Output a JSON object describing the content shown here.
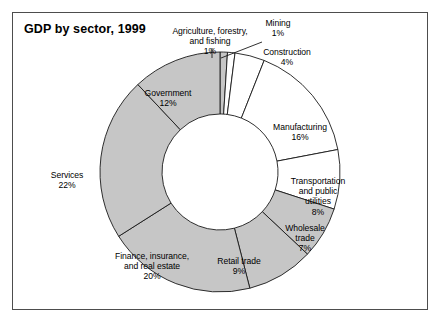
{
  "figure": {
    "title": "GDP by sector, 1999",
    "frame_color": "#4d4d4d",
    "background": "#ffffff"
  },
  "chart_data": {
    "type": "pie",
    "variant": "donut",
    "title": "GDP by sector, 1999",
    "xlabel": "",
    "ylabel": "",
    "units": "percent of GDP",
    "year": "1999",
    "total": 100,
    "legend": "none",
    "grid": false,
    "start_angle_deg": 0,
    "direction": "clockwise",
    "categories": [
      "Agriculture, forestry, and fishing",
      "Mining",
      "Construction",
      "Manufacturing",
      "Transportation and public utilities",
      "Wholesale trade",
      "Retail trade",
      "Finance, insurance, and real estate",
      "Services",
      "Government"
    ],
    "values": [
      1,
      1,
      4,
      16,
      8,
      7,
      9,
      20,
      22,
      12
    ],
    "slices": [
      {
        "label": "Agriculture, forestry,\nand fishing",
        "label_flat": "Agriculture, forestry, and fishing",
        "value": 1,
        "pct_text": "1%",
        "fill": "#c6c6c6",
        "label_x": 152,
        "label_y": 26,
        "label_w": 116,
        "label_align": "center",
        "leader": [
          [
            212,
            58
          ],
          [
            212,
            48
          ]
        ]
      },
      {
        "label": "Mining",
        "label_flat": "Mining",
        "value": 1,
        "pct_text": "1%",
        "fill": "#ffffff",
        "label_x": 252,
        "label_y": 18,
        "label_w": 52,
        "label_align": "center",
        "leader": [
          [
            221,
            58
          ],
          [
            262,
            42
          ]
        ]
      },
      {
        "label": "Construction",
        "label_flat": "Construction",
        "value": 4,
        "pct_text": "4%",
        "fill": "#ffffff",
        "label_x": 250,
        "label_y": 47,
        "label_w": 74,
        "label_align": "center",
        "leader": null
      },
      {
        "label": "Manufacturing",
        "label_flat": "Manufacturing",
        "value": 16,
        "pct_text": "16%",
        "fill": "#ffffff",
        "label_x": 258,
        "label_y": 122,
        "label_w": 84,
        "label_align": "center",
        "leader": null
      },
      {
        "label": "Transportation\nand public\nutilities",
        "label_flat": "Transportation and public utilities",
        "value": 8,
        "pct_text": "8%",
        "fill": "#ffffff",
        "label_x": 277,
        "label_y": 176,
        "label_w": 82,
        "label_align": "center",
        "leader": null
      },
      {
        "label": "Wholesale\ntrade",
        "label_flat": "Wholesale trade",
        "value": 7,
        "pct_text": "7%",
        "fill": "#c6c6c6",
        "label_x": 272,
        "label_y": 223,
        "label_w": 66,
        "label_align": "center",
        "leader": null
      },
      {
        "label": "Retail trade",
        "label_flat": "Retail trade",
        "value": 9,
        "pct_text": "9%",
        "fill": "#c6c6c6",
        "label_x": 202,
        "label_y": 256,
        "label_w": 74,
        "label_align": "center",
        "leader": null
      },
      {
        "label": "Finance, insurance,\nand real estate",
        "label_flat": "Finance, insurance, and real estate",
        "value": 20,
        "pct_text": "20%",
        "fill": "#c6c6c6",
        "label_x": 100,
        "label_y": 251,
        "label_w": 104,
        "label_align": "center",
        "leader": null
      },
      {
        "label": "Services",
        "label_flat": "Services",
        "value": 22,
        "pct_text": "22%",
        "fill": "#c6c6c6",
        "label_x": 36,
        "label_y": 170,
        "label_w": 62,
        "label_align": "center",
        "leader": null
      },
      {
        "label": "Government",
        "label_flat": "Government",
        "value": 12,
        "pct_text": "12%",
        "fill": "#c6c6c6",
        "label_x": 126,
        "label_y": 88,
        "label_w": 84,
        "label_align": "center",
        "leader": null
      }
    ],
    "geometry": {
      "cx": 220,
      "cy": 172,
      "outer_r": 120,
      "inner_r": 58,
      "stroke": "#1a1a1a",
      "stroke_width": 0.9
    }
  }
}
